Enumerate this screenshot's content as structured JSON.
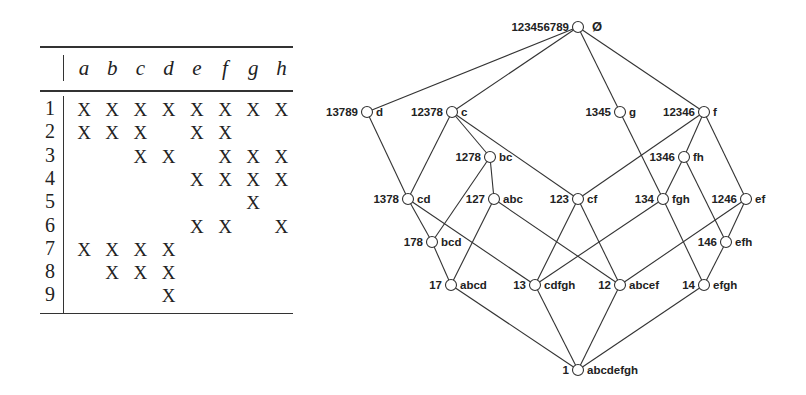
{
  "context_table": {
    "attributes": [
      "a",
      "b",
      "c",
      "d",
      "e",
      "f",
      "g",
      "h"
    ],
    "objects": [
      "1",
      "2",
      "3",
      "4",
      "5",
      "6",
      "7",
      "8",
      "9"
    ],
    "mark": "X",
    "incidence": [
      [
        1,
        1,
        1,
        1,
        1,
        1,
        1,
        1
      ],
      [
        1,
        1,
        1,
        0,
        1,
        1,
        0,
        0
      ],
      [
        0,
        0,
        1,
        1,
        0,
        1,
        1,
        1
      ],
      [
        0,
        0,
        0,
        0,
        1,
        1,
        1,
        1
      ],
      [
        0,
        0,
        0,
        0,
        0,
        0,
        1,
        0
      ],
      [
        0,
        0,
        0,
        0,
        1,
        1,
        0,
        1
      ],
      [
        1,
        1,
        1,
        1,
        0,
        0,
        0,
        0
      ],
      [
        0,
        1,
        1,
        1,
        0,
        0,
        0,
        0
      ],
      [
        0,
        0,
        0,
        1,
        0,
        0,
        0,
        0
      ]
    ]
  },
  "lattice": {
    "nodes": [
      {
        "id": "top",
        "extent": "123456789",
        "intent": "Ø",
        "x": 578,
        "y": 27
      },
      {
        "id": "d",
        "extent": "13789",
        "intent": "d",
        "x": 367,
        "y": 112
      },
      {
        "id": "c",
        "extent": "12378",
        "intent": "c",
        "x": 452,
        "y": 112
      },
      {
        "id": "g",
        "extent": "1345",
        "intent": "g",
        "x": 620,
        "y": 112
      },
      {
        "id": "f",
        "extent": "12346",
        "intent": "f",
        "x": 704,
        "y": 112
      },
      {
        "id": "bc",
        "extent": "1278",
        "intent": "bc",
        "x": 490,
        "y": 157
      },
      {
        "id": "fh",
        "extent": "1346",
        "intent": "fh",
        "x": 684,
        "y": 157
      },
      {
        "id": "cd",
        "extent": "1378",
        "intent": "cd",
        "x": 408,
        "y": 199
      },
      {
        "id": "abc",
        "extent": "127",
        "intent": "abc",
        "x": 494,
        "y": 199
      },
      {
        "id": "cf",
        "extent": "123",
        "intent": "cf",
        "x": 578,
        "y": 199
      },
      {
        "id": "fgh",
        "extent": "134",
        "intent": "fgh",
        "x": 663,
        "y": 199
      },
      {
        "id": "ef",
        "extent": "1246",
        "intent": "ef",
        "x": 746,
        "y": 199
      },
      {
        "id": "bcd",
        "extent": "178",
        "intent": "bcd",
        "x": 432,
        "y": 242
      },
      {
        "id": "efh",
        "extent": "146",
        "intent": "efh",
        "x": 726,
        "y": 242
      },
      {
        "id": "abcd",
        "extent": "17",
        "intent": "abcd",
        "x": 451,
        "y": 285
      },
      {
        "id": "cdfgh",
        "extent": "13",
        "intent": "cdfgh",
        "x": 535,
        "y": 285
      },
      {
        "id": "abcef",
        "extent": "12",
        "intent": "abcef",
        "x": 620,
        "y": 285
      },
      {
        "id": "efgh",
        "extent": "14",
        "intent": "efgh",
        "x": 704,
        "y": 285
      },
      {
        "id": "bottom",
        "extent": "1",
        "intent": "abcdefgh",
        "x": 578,
        "y": 370
      }
    ],
    "edges": [
      [
        "top",
        "d"
      ],
      [
        "top",
        "c"
      ],
      [
        "top",
        "g"
      ],
      [
        "top",
        "f"
      ],
      [
        "d",
        "cd"
      ],
      [
        "c",
        "cd"
      ],
      [
        "c",
        "bc"
      ],
      [
        "c",
        "cf"
      ],
      [
        "bc",
        "bcd"
      ],
      [
        "bc",
        "abc"
      ],
      [
        "g",
        "fgh"
      ],
      [
        "f",
        "cf"
      ],
      [
        "f",
        "fh"
      ],
      [
        "f",
        "ef"
      ],
      [
        "fh",
        "fgh"
      ],
      [
        "fh",
        "efh"
      ],
      [
        "cd",
        "bcd"
      ],
      [
        "cd",
        "cdfgh"
      ],
      [
        "abc",
        "abcd"
      ],
      [
        "abc",
        "abcef"
      ],
      [
        "cf",
        "cdfgh"
      ],
      [
        "cf",
        "abcef"
      ],
      [
        "fgh",
        "cdfgh"
      ],
      [
        "fgh",
        "efgh"
      ],
      [
        "ef",
        "abcef"
      ],
      [
        "ef",
        "efh"
      ],
      [
        "bcd",
        "abcd"
      ],
      [
        "efh",
        "efgh"
      ],
      [
        "abcd",
        "bottom"
      ],
      [
        "cdfgh",
        "bottom"
      ],
      [
        "abcef",
        "bottom"
      ],
      [
        "efgh",
        "bottom"
      ]
    ]
  }
}
